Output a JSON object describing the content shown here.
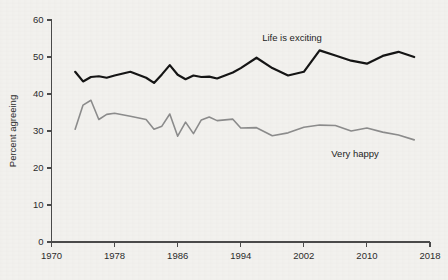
{
  "chart_data": {
    "type": "line",
    "title": "",
    "subtitle": "",
    "xlabel": "",
    "ylabel": "Percent agreeing",
    "xlim": [
      1970,
      2018
    ],
    "ylim": [
      0,
      60
    ],
    "grid": false,
    "legend_position": "inline-annotation",
    "x_ticks": [
      1970,
      1978,
      1986,
      1994,
      2002,
      2010,
      2018
    ],
    "x_tick_labels": [
      "1970",
      "1978",
      "1986",
      "1994",
      "2002",
      "2010",
      "2018"
    ],
    "y_ticks": [
      0,
      10,
      20,
      30,
      40,
      50,
      60
    ],
    "y_tick_labels": [
      "0",
      "10",
      "20",
      "30",
      "40",
      "50",
      "60"
    ],
    "series": [
      {
        "name": "Life is exciting",
        "color": "#141414",
        "width": 2.2,
        "label_x": 2000.5,
        "label_y": 54.2,
        "x": [
          1973,
          1974,
          1975,
          1976,
          1977,
          1978,
          1980,
          1982,
          1983,
          1984,
          1985,
          1986,
          1987,
          1988,
          1989,
          1990,
          1991,
          1993,
          1994,
          1996,
          1998,
          2000,
          2002,
          2004,
          2006,
          2008,
          2010,
          2012,
          2014,
          2016
        ],
        "y": [
          46.0,
          43.4,
          44.6,
          44.8,
          44.4,
          45.0,
          46.0,
          44.4,
          43.0,
          45.3,
          47.8,
          45.2,
          44.0,
          45.0,
          44.6,
          44.7,
          44.2,
          45.8,
          47.0,
          49.8,
          47.0,
          45.0,
          46.0,
          51.8,
          50.4,
          49.0,
          48.2,
          50.3,
          51.4,
          50.0
        ]
      },
      {
        "name": "Very happy",
        "color": "#8c8c8c",
        "width": 1.6,
        "label_x": 2008.5,
        "label_y": 23.0,
        "x": [
          1973,
          1974,
          1975,
          1976,
          1977,
          1978,
          1980,
          1982,
          1983,
          1984,
          1985,
          1986,
          1987,
          1988,
          1989,
          1990,
          1991,
          1993,
          1994,
          1996,
          1998,
          2000,
          2002,
          2004,
          2006,
          2008,
          2010,
          2012,
          2014,
          2016
        ],
        "x_dense": [
          1973,
          1974,
          1975,
          1976,
          1977,
          1978,
          1980,
          1982,
          1983,
          1984,
          1985,
          1986,
          1987,
          1988,
          1989,
          1990,
          1991,
          1993,
          1994,
          1996,
          1998,
          2000,
          2002,
          2004,
          2006,
          2008,
          2010,
          2012,
          2014,
          2016
        ],
        "y": [
          30.5,
          37.0,
          38.3,
          33.1,
          34.5,
          34.8,
          34.0,
          33.1,
          30.5,
          31.3,
          34.6,
          28.6,
          32.4,
          29.3,
          33.0,
          33.8,
          32.8,
          33.2,
          30.8,
          30.9,
          28.7,
          29.5,
          31.0,
          31.6,
          31.5,
          30.0,
          30.8,
          29.7,
          28.9,
          27.6
        ]
      }
    ],
    "annotations": [
      {
        "text": "Life is exciting",
        "x": 2000.5,
        "y": 54.2
      },
      {
        "text": "Very happy",
        "x": 2008.5,
        "y": 23.0
      }
    ],
    "background_color": "#f2f1ee",
    "axis_color": "#4a4a4a",
    "text_color": "#2b2b2b"
  }
}
